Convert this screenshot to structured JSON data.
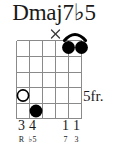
{
  "chord": {
    "name": "Dmaj7b5",
    "name_display": "Dmaj7♭5",
    "position_label": "5fr.",
    "instrument": "guitar",
    "string_count": 6,
    "fret_count": 5,
    "base_fret": 5,
    "has_nut": false,
    "barre": {
      "present": true,
      "fret": 1,
      "from_string": 2,
      "to_string": 1,
      "finger": "1"
    },
    "string_markers": [
      {
        "string": 6,
        "marker": "open-circle",
        "fret": 4,
        "finger": "3",
        "interval": "R"
      },
      {
        "string": 5,
        "marker": "filled-dot",
        "fret": 5,
        "finger": "4",
        "interval": "♭5"
      },
      {
        "string": 4,
        "marker": "none",
        "fret": 0,
        "finger": "",
        "interval": ""
      },
      {
        "string": 3,
        "marker": "muted-x",
        "fret": 0,
        "finger": "",
        "interval": ""
      },
      {
        "string": 2,
        "marker": "filled-dot",
        "fret": 1,
        "finger": "1",
        "interval": "7"
      },
      {
        "string": 1,
        "marker": "filled-dot",
        "fret": 1,
        "finger": "1",
        "interval": "3"
      }
    ],
    "finger_row": [
      "3",
      "4",
      "",
      "",
      "1",
      "1"
    ],
    "interval_row": [
      "R",
      "♭5",
      "",
      "",
      "7",
      "3"
    ]
  },
  "colors": {
    "ink": "#1a1a1a",
    "grid_line": "#8a8a8a",
    "dot_fill": "#000000",
    "open_circle_stroke": "#000000",
    "background": "#ffffff"
  }
}
